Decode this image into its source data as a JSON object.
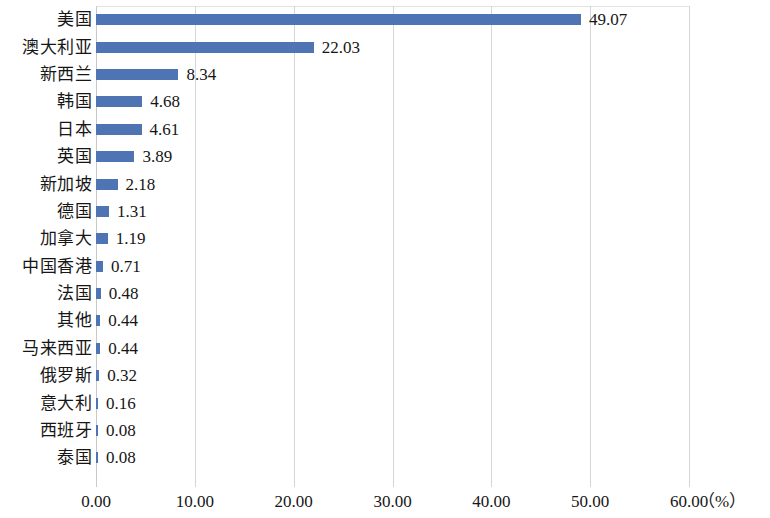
{
  "chart_data": {
    "type": "bar",
    "orientation": "horizontal",
    "title": "",
    "subtitle": "",
    "xlabel": "（%）",
    "ylabel": "",
    "xlim": [
      0,
      60
    ],
    "xticks": [
      "0.00",
      "10.00",
      "20.00",
      "30.00",
      "40.00",
      "50.00",
      "60.00"
    ],
    "xtick_values": [
      0,
      10,
      20,
      30,
      40,
      50,
      60
    ],
    "grid": "vertical",
    "legend": "none",
    "series_color": "#4f74b4",
    "categories": [
      "美国",
      "澳大利亚",
      "新西兰",
      "韩国",
      "日本",
      "英国",
      "新加坡",
      "德国",
      "加拿大",
      "中国香港",
      "法国",
      "其他",
      "马来西亚",
      "俄罗斯",
      "意大利",
      "西班牙",
      "泰国"
    ],
    "values": [
      49.07,
      22.03,
      8.34,
      4.68,
      4.61,
      3.89,
      2.18,
      1.31,
      1.19,
      0.71,
      0.48,
      0.44,
      0.44,
      0.32,
      0.16,
      0.08,
      0.08
    ],
    "value_labels": [
      "49.07",
      "22.03",
      "8.34",
      "4.68",
      "4.61",
      "3.89",
      "2.18",
      "1.31",
      "1.19",
      "0.71",
      "0.48",
      "0.44",
      "0.44",
      "0.32",
      "0.16",
      "0.08",
      "0.08"
    ]
  }
}
